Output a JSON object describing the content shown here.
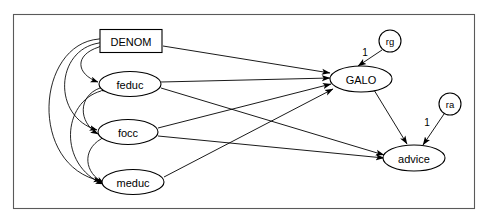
{
  "figure": {
    "type": "path-diagram",
    "frame": {
      "x": 13,
      "y": 14,
      "width": 462,
      "height": 195,
      "stroke": "#5a5a5a"
    }
  },
  "nodes": [
    {
      "id": "denom",
      "label": "DENOM",
      "shape": "rect",
      "cx": 131,
      "cy": 41,
      "rx": 31,
      "ry": 11.5
    },
    {
      "id": "feduc",
      "label": "feduc",
      "shape": "ellipse",
      "cx": 130,
      "cy": 84,
      "rx": 31,
      "ry": 12.5
    },
    {
      "id": "focc",
      "label": "focc",
      "shape": "ellipse",
      "cx": 128,
      "cy": 132,
      "rx": 30,
      "ry": 12.5
    },
    {
      "id": "meduc",
      "label": "meduc",
      "shape": "ellipse",
      "cx": 133,
      "cy": 182,
      "rx": 31,
      "ry": 12.5
    },
    {
      "id": "galo",
      "label": "GALO",
      "shape": "ellipse",
      "cx": 361,
      "cy": 79,
      "rx": 31,
      "ry": 13
    },
    {
      "id": "advice",
      "label": "advice",
      "shape": "ellipse",
      "cx": 414,
      "cy": 158,
      "rx": 31,
      "ry": 13
    },
    {
      "id": "rg",
      "label": "rg",
      "shape": "circle",
      "cx": 390,
      "cy": 41,
      "rx": 11,
      "ry": 11
    },
    {
      "id": "ra",
      "label": "ra",
      "shape": "circle",
      "cx": 450,
      "cy": 104,
      "rx": 11,
      "ry": 11
    }
  ],
  "edges": [
    {
      "id": "denom-galo",
      "from": "denom",
      "to": "galo",
      "kind": "directed",
      "label": ""
    },
    {
      "id": "feduc-galo",
      "from": "feduc",
      "to": "galo",
      "kind": "directed",
      "label": ""
    },
    {
      "id": "focc-galo",
      "from": "focc",
      "to": "galo",
      "kind": "directed",
      "label": ""
    },
    {
      "id": "meduc-galo",
      "from": "meduc",
      "to": "galo",
      "kind": "directed",
      "label": ""
    },
    {
      "id": "feduc-advice",
      "from": "feduc",
      "to": "advice",
      "kind": "directed",
      "label": ""
    },
    {
      "id": "focc-advice",
      "from": "focc",
      "to": "advice",
      "kind": "directed",
      "label": ""
    },
    {
      "id": "galo-advice",
      "from": "galo",
      "to": "advice",
      "kind": "directed",
      "label": ""
    },
    {
      "id": "rg-galo",
      "from": "rg",
      "to": "galo",
      "kind": "directed",
      "label": "1"
    },
    {
      "id": "ra-advice",
      "from": "ra",
      "to": "advice",
      "kind": "directed",
      "label": "1"
    },
    {
      "id": "cov-denom-feduc",
      "from": "denom",
      "to": "feduc",
      "kind": "covariance",
      "label": ""
    },
    {
      "id": "cov-denom-focc",
      "from": "denom",
      "to": "focc",
      "kind": "covariance",
      "label": ""
    },
    {
      "id": "cov-denom-meduc",
      "from": "denom",
      "to": "meduc",
      "kind": "covariance",
      "label": ""
    },
    {
      "id": "cov-feduc-focc",
      "from": "feduc",
      "to": "focc",
      "kind": "covariance",
      "label": ""
    },
    {
      "id": "cov-feduc-meduc",
      "from": "feduc",
      "to": "meduc",
      "kind": "covariance",
      "label": ""
    },
    {
      "id": "cov-focc-meduc",
      "from": "focc",
      "to": "meduc",
      "kind": "covariance",
      "label": ""
    }
  ],
  "edge_labels": {
    "rg_loading": "1",
    "ra_loading": "1"
  }
}
